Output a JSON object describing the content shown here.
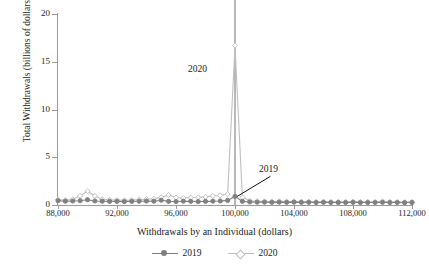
{
  "chart_data": {
    "type": "line",
    "title": "",
    "xlabel": "Withdrawals by an Individual (dollars)",
    "ylabel": "Total Withdrawals (billions of dollars)",
    "xlim": [
      88000,
      112000
    ],
    "ylim": [
      0,
      20
    ],
    "xticks": [
      88000,
      92000,
      96000,
      100000,
      104000,
      108000,
      112000
    ],
    "xticklabels": [
      "88,000",
      "92,000",
      "96,000",
      "100,000",
      "104,000",
      "108,000",
      "112,000"
    ],
    "yticks": [
      0,
      5,
      10,
      15,
      20
    ],
    "yticklabels": [
      "0",
      "5",
      "10",
      "15",
      "20"
    ],
    "grid": false,
    "legend_position": "bottom",
    "annotations": [
      {
        "text": "2020",
        "x": 95800,
        "y": 14.0,
        "leader": false
      },
      {
        "text": "2019",
        "x": 102600,
        "y": 3.3,
        "leader": true,
        "leader_from_x": 102400,
        "leader_from_y": 3.0,
        "leader_to_x": 100150,
        "leader_to_y": 0.9
      }
    ],
    "x": [
      88000,
      88500,
      89000,
      89500,
      90000,
      90500,
      91000,
      91500,
      92000,
      92500,
      93000,
      93500,
      94000,
      94500,
      95000,
      95500,
      96000,
      96500,
      97000,
      97500,
      98000,
      98500,
      99000,
      99500,
      100000,
      100500,
      101000,
      101500,
      102000,
      102500,
      103000,
      103500,
      104000,
      104500,
      105000,
      105500,
      106000,
      106500,
      107000,
      107500,
      108000,
      108500,
      109000,
      109500,
      110000,
      110500,
      111000,
      111500,
      112000
    ],
    "series": [
      {
        "name": "2019",
        "color": "#808080",
        "marker": "circle",
        "values": [
          0.45,
          0.4,
          0.42,
          0.45,
          0.55,
          0.42,
          0.4,
          0.38,
          0.38,
          0.36,
          0.38,
          0.4,
          0.42,
          0.4,
          0.5,
          0.38,
          0.36,
          0.4,
          0.38,
          0.36,
          0.38,
          0.4,
          0.42,
          0.48,
          0.9,
          0.38,
          0.32,
          0.3,
          0.3,
          0.28,
          0.3,
          0.28,
          0.3,
          0.28,
          0.28,
          0.26,
          0.28,
          0.26,
          0.26,
          0.26,
          0.28,
          0.26,
          0.26,
          0.26,
          0.28,
          0.26,
          0.26,
          0.24,
          0.26
        ]
      },
      {
        "name": "2020",
        "color": "#bfbfbf",
        "marker": "diamond",
        "values": [
          0.55,
          0.52,
          0.6,
          0.95,
          1.45,
          0.95,
          0.6,
          0.55,
          0.52,
          0.5,
          0.52,
          0.58,
          0.62,
          0.65,
          0.8,
          1.05,
          0.78,
          0.72,
          0.78,
          0.8,
          0.85,
          0.95,
          1.0,
          1.15,
          16.7,
          0.8,
          0.45,
          0.4,
          0.38,
          0.36,
          0.38,
          0.36,
          0.38,
          0.35,
          0.35,
          0.33,
          0.35,
          0.33,
          0.33,
          0.33,
          0.35,
          0.33,
          0.33,
          0.33,
          0.38,
          0.33,
          0.33,
          0.3,
          0.33
        ]
      }
    ],
    "vertical_reference_line": {
      "x": 100000,
      "color": "#707070"
    },
    "legend": [
      {
        "label": "2019",
        "color": "#808080",
        "marker": "circle"
      },
      {
        "label": "2020",
        "color": "#bfbfbf",
        "marker": "diamond"
      }
    ]
  }
}
